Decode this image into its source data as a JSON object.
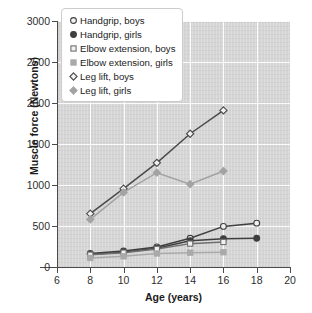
{
  "chart_data": {
    "type": "line",
    "title": "",
    "xlabel": "Age (years)",
    "ylabel": "Muscle force (Newtons)",
    "xlim": [
      6,
      20
    ],
    "ylim": [
      0,
      3000
    ],
    "xticks": [
      6,
      8,
      10,
      12,
      14,
      16,
      18,
      20
    ],
    "yticks": [
      0,
      500,
      1000,
      1500,
      2000,
      2500,
      3000
    ],
    "grid": true,
    "legend_position": "upper left",
    "panel_color": "#d5d5d5",
    "gridline_color": "#fbfbfb",
    "series": [
      {
        "name": "Handgrip, boys",
        "marker": "circle-open",
        "color": "#3f3f3f",
        "x": [
          8,
          10,
          12,
          14,
          16,
          18
        ],
        "values": [
          165,
          195,
          245,
          350,
          495,
          535
        ]
      },
      {
        "name": "Handgrip, girls",
        "marker": "circle-filled",
        "color": "#3f3f3f",
        "x": [
          8,
          10,
          12,
          14,
          16,
          18
        ],
        "values": [
          155,
          180,
          230,
          320,
          345,
          350
        ]
      },
      {
        "name": "Elbow extension, boys",
        "marker": "square-open",
        "color": "#6f6f6f",
        "x": [
          8,
          10,
          12,
          14,
          16
        ],
        "values": [
          150,
          175,
          220,
          285,
          305
        ]
      },
      {
        "name": "Elbow extension, girls",
        "marker": "square-filled",
        "color": "#a9a9a9",
        "x": [
          8,
          10,
          12,
          14,
          16
        ],
        "values": [
          110,
          130,
          165,
          175,
          180
        ]
      },
      {
        "name": "Leg lift, boys",
        "marker": "diamond-open",
        "color": "#4a4a4a",
        "x": [
          8,
          10,
          12,
          14,
          16
        ],
        "values": [
          650,
          955,
          1270,
          1625,
          1910
        ]
      },
      {
        "name": "Leg lift, girls",
        "marker": "diamond-filled",
        "color": "#a3a3a3",
        "x": [
          8,
          10,
          12,
          14,
          16
        ],
        "values": [
          580,
          910,
          1150,
          1010,
          1170
        ]
      }
    ]
  },
  "axes": {
    "ylabel": "Muscle force (Newtons)",
    "xlabel": "Age (years)",
    "yticks": [
      "0",
      "500",
      "1000",
      "1500",
      "2000",
      "2500",
      "3000"
    ],
    "xticks": [
      "6",
      "8",
      "10",
      "12",
      "14",
      "16",
      "18",
      "20"
    ]
  },
  "legend": {
    "items": [
      {
        "label": "Handgrip, boys"
      },
      {
        "label": "Handgrip, girls"
      },
      {
        "label": "Elbow extension, boys"
      },
      {
        "label": "Elbow extension, girls"
      },
      {
        "label": "Leg lift, boys"
      },
      {
        "label": "Leg lift, girls"
      }
    ]
  }
}
